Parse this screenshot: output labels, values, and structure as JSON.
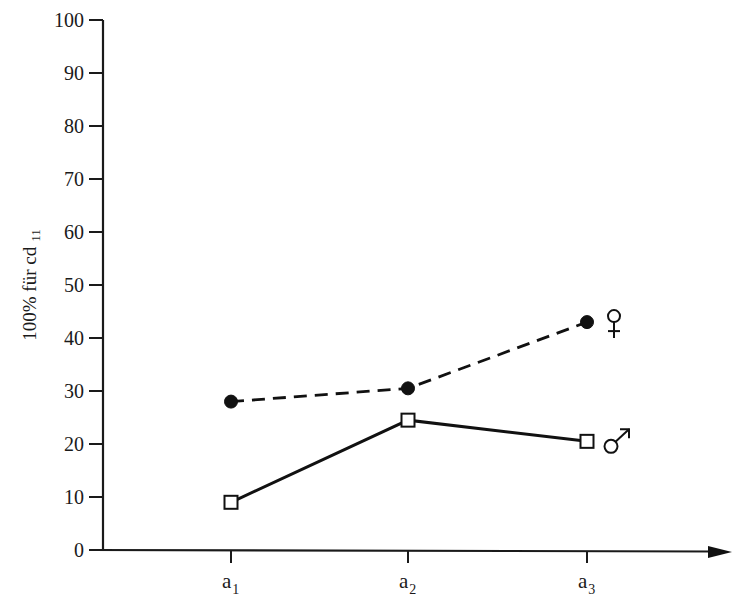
{
  "chart_data": {
    "type": "line",
    "title": "",
    "xlabel": "",
    "ylabel": "100% für cd",
    "ylabel_subscript": "11",
    "categories": [
      "a1",
      "a2",
      "a3"
    ],
    "category_labels": [
      {
        "base": "a",
        "sub": "1"
      },
      {
        "base": "a",
        "sub": "2"
      },
      {
        "base": "a",
        "sub": "3"
      }
    ],
    "ylim": [
      0,
      100
    ],
    "yticks": [
      0,
      10,
      20,
      30,
      40,
      50,
      60,
      70,
      80,
      90,
      100
    ],
    "grid": false,
    "legend_position": "inline-right-of-last-point",
    "series": [
      {
        "name": "♀",
        "label": "female",
        "marker": "filled-circle",
        "line_style": "dashed",
        "values": [
          28,
          30.5,
          43
        ]
      },
      {
        "name": "♂",
        "label": "male",
        "marker": "open-square",
        "line_style": "solid",
        "values": [
          9,
          24.5,
          20.5
        ]
      }
    ]
  },
  "layout": {
    "plot": {
      "x0": 103,
      "y0": 550,
      "y100": 20,
      "x_axis_end": 732
    },
    "category_x": [
      231,
      408,
      587
    ]
  }
}
